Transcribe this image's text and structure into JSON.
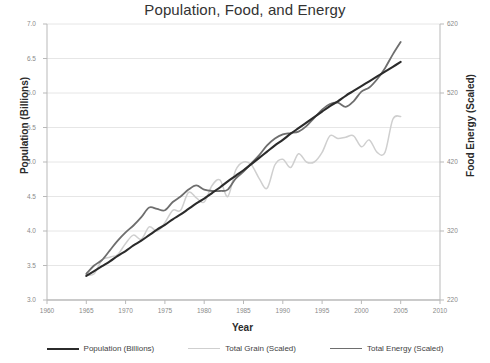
{
  "chart_data": {
    "type": "line",
    "title": "Population, Food, and Energy",
    "xlabel": "Year",
    "ylabel": "Population (Billions)",
    "y2label": "Food Energy (Scaled)",
    "xlim": [
      1960,
      2010
    ],
    "ylim": [
      3.0,
      7.0
    ],
    "y2lim": [
      220,
      620
    ],
    "grid": true,
    "legend_position": "bottom",
    "xticks": [
      1960,
      1965,
      1970,
      1975,
      1980,
      1985,
      1990,
      1995,
      2000,
      2005,
      2010
    ],
    "xtick_labels": [
      "1960",
      "1965",
      "1970",
      "1975",
      "1980",
      "1985",
      "1990",
      "1995",
      "2000",
      "2005",
      "2010"
    ],
    "yticks": [
      3.0,
      3.5,
      4.0,
      4.5,
      5.0,
      5.5,
      6.0,
      6.5,
      7.0
    ],
    "ytick_labels": [
      "3.0",
      "3.5",
      "4.0",
      "4.5",
      "5.0",
      "5.5",
      "6.0",
      "6.5",
      "7.0"
    ],
    "y2ticks": [
      220,
      320,
      420,
      520,
      620
    ],
    "y2tick_labels": [
      "220",
      "320",
      "420",
      "520",
      "620"
    ],
    "x": [
      1965,
      1966,
      1967,
      1968,
      1969,
      1970,
      1971,
      1972,
      1973,
      1974,
      1975,
      1976,
      1977,
      1978,
      1979,
      1980,
      1981,
      1982,
      1983,
      1984,
      1985,
      1986,
      1987,
      1988,
      1989,
      1990,
      1991,
      1992,
      1993,
      1994,
      1995,
      1996,
      1997,
      1998,
      1999,
      2000,
      2001,
      2002,
      2003,
      2004,
      2005
    ],
    "series": [
      {
        "name": "Population (Billions)",
        "color": "#2b2b2b",
        "width": 2.1,
        "values": [
          3.35,
          3.42,
          3.49,
          3.56,
          3.64,
          3.71,
          3.79,
          3.86,
          3.94,
          4.02,
          4.09,
          4.17,
          4.24,
          4.32,
          4.4,
          4.47,
          4.55,
          4.63,
          4.72,
          4.8,
          4.88,
          4.97,
          5.06,
          5.15,
          5.24,
          5.32,
          5.41,
          5.49,
          5.57,
          5.65,
          5.73,
          5.81,
          5.88,
          5.96,
          6.03,
          6.1,
          6.17,
          6.24,
          6.31,
          6.38,
          6.45
        ]
      },
      {
        "name": "Total Grain (Scaled)",
        "color": "#cfcfcf",
        "width": 1.5,
        "values": [
          3.36,
          3.38,
          3.58,
          3.62,
          3.66,
          3.82,
          3.94,
          3.88,
          4.06,
          4.0,
          4.12,
          4.3,
          4.3,
          4.56,
          4.48,
          4.42,
          4.66,
          4.74,
          4.5,
          4.88,
          5.0,
          4.96,
          4.76,
          4.62,
          4.96,
          5.04,
          4.92,
          5.12,
          5.0,
          5.0,
          5.14,
          5.38,
          5.34,
          5.36,
          5.38,
          5.22,
          5.32,
          5.14,
          5.14,
          5.62,
          5.66
        ]
      },
      {
        "name": "Total Energy (Scaled)",
        "color": "#6e6e6e",
        "width": 1.8,
        "values": [
          3.38,
          3.5,
          3.58,
          3.72,
          3.86,
          3.98,
          4.08,
          4.2,
          4.34,
          4.32,
          4.3,
          4.42,
          4.5,
          4.6,
          4.66,
          4.6,
          4.58,
          4.58,
          4.6,
          4.76,
          4.86,
          4.98,
          5.1,
          5.24,
          5.34,
          5.4,
          5.42,
          5.44,
          5.52,
          5.64,
          5.76,
          5.84,
          5.86,
          5.8,
          5.88,
          6.02,
          6.08,
          6.2,
          6.36,
          6.56,
          6.74
        ]
      }
    ]
  },
  "axes": {
    "left_title": "Population (Billions)",
    "right_title": "Food Energy (Scaled)",
    "bottom_title": "Year"
  }
}
